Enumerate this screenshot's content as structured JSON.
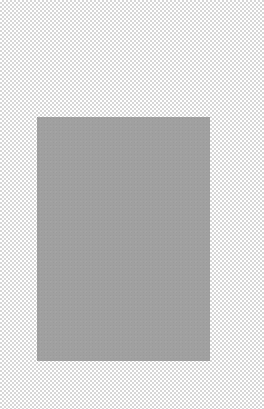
{
  "canvas": {
    "background": "transparency-checkerboard",
    "checker_colors": [
      "#ffffff",
      "#d6d6d6"
    ]
  },
  "shape": {
    "type": "rectangle",
    "fill": "#a0a0a0",
    "x": 37,
    "y": 117,
    "width": 173,
    "height": 244
  }
}
